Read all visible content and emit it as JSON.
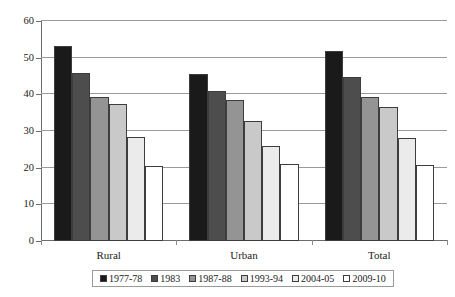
{
  "chart_data": {
    "type": "bar",
    "title": "",
    "xlabel": "",
    "ylabel": "",
    "ylim": [
      0,
      60
    ],
    "ytick_labels": [
      "60",
      "50",
      "40",
      "30",
      "20",
      "10",
      "0"
    ],
    "ytick_values": [
      60,
      50,
      40,
      30,
      20,
      10,
      0
    ],
    "grid": true,
    "legend_position": "bottom",
    "categories": [
      "Rural",
      "Urban",
      "Total"
    ],
    "series": [
      {
        "name": "1977-78",
        "color": "#1a1a1a",
        "values": [
          53.3,
          45.5,
          51.7
        ]
      },
      {
        "name": "1983",
        "color": "#4d4d4d",
        "values": [
          45.8,
          41.0,
          44.8
        ]
      },
      {
        "name": "1987-88",
        "color": "#949494",
        "values": [
          39.3,
          38.5,
          39.3
        ]
      },
      {
        "name": "1993-94",
        "color": "#c9c9c9",
        "values": [
          37.4,
          32.7,
          36.5
        ]
      },
      {
        "name": "2004-05",
        "color": "#ebebeb",
        "values": [
          28.5,
          26.0,
          28.0
        ]
      },
      {
        "name": "2009-10",
        "color": "#ffffff",
        "values": [
          20.5,
          21.0,
          20.7
        ]
      }
    ]
  },
  "legend": {
    "items": [
      {
        "label": "1977-78"
      },
      {
        "label": "1983"
      },
      {
        "label": "1987-88"
      },
      {
        "label": "1993-94"
      },
      {
        "label": "2004-05"
      },
      {
        "label": "2009-10"
      }
    ]
  },
  "axis": {
    "y_labels": [
      "60",
      "50",
      "40",
      "30",
      "20",
      "10",
      "0"
    ],
    "x_labels": [
      "Rural",
      "Urban",
      "Total"
    ]
  }
}
